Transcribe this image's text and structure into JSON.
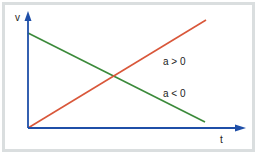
{
  "diagram": {
    "y_axis_label": "v",
    "x_axis_label": "t",
    "lines": [
      {
        "label": "a > 0",
        "color": "#d9573a",
        "description": "velocity increases with time"
      },
      {
        "label": "a < 0",
        "color": "#3b8a3a",
        "description": "velocity decreases with time"
      }
    ],
    "axis_color": "#1f4fa8",
    "frame_color": "#dadedf"
  }
}
